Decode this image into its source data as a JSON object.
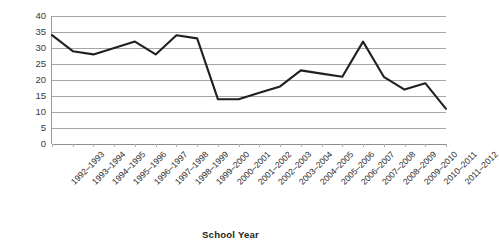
{
  "chart_data": {
    "type": "line",
    "title": "",
    "subtitle": "",
    "xlabel": "School Year",
    "ylabel": "",
    "ylim": [
      0,
      40
    ],
    "ytick_step": 5,
    "yticks": [
      40,
      35,
      30,
      25,
      20,
      15,
      10,
      5,
      0
    ],
    "grid": true,
    "legend": false,
    "legend_position": "none",
    "line_color": "#231f20",
    "categories": [
      "1992–1993",
      "1993–1994",
      "1994–1995",
      "1995–1996",
      "1996–1997",
      "1997–1998",
      "1998–1999",
      "1999–2000",
      "2000–2001",
      "2001–2002",
      "2002–2003",
      "2003–2004",
      "2004–2005",
      "2005–2006",
      "2006–2007",
      "2007–2008",
      "2008–2009",
      "2009–2010",
      "2010–2011",
      "2011–2012"
    ],
    "values": [
      34,
      29,
      28,
      30,
      32,
      28,
      34,
      33,
      14,
      14,
      16,
      18,
      23,
      22,
      21,
      32,
      21,
      17,
      19,
      11
    ],
    "values_note_final": 15,
    "series": [
      {
        "name": "",
        "values": [
          34,
          29,
          28,
          30,
          32,
          28,
          34,
          33,
          14,
          14,
          16,
          18,
          23,
          22,
          21,
          32,
          21,
          17,
          19,
          11
        ]
      }
    ]
  },
  "axis": {
    "x_title": "School Year"
  },
  "colors": {
    "line": "#231f20",
    "grid": "#a6a6a6",
    "axis": "#9a9a9a",
    "text": "#231f20",
    "background": "#ffffff"
  }
}
